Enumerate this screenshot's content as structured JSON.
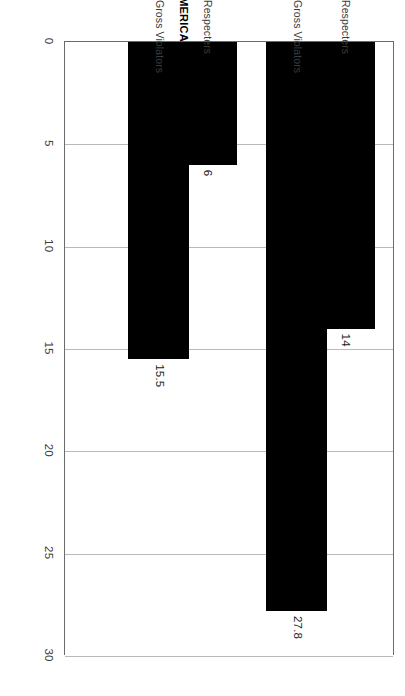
{
  "chart_data": {
    "type": "bar",
    "orientation": "horizontal",
    "title": "",
    "subtitle": "",
    "xlabel": "",
    "ylabel": "",
    "xlim": [
      0,
      30
    ],
    "ylim": null,
    "grid": true,
    "grid_axis": "value",
    "legend": false,
    "legend_position": "none",
    "bar_color": "#000000",
    "axis_color": "#6b6b6b",
    "gridline_color": "#b9b9b9",
    "categories": [
      "Respecters",
      "Gross Violators",
      "Respecters",
      "Gross Violators"
    ],
    "values": [
      14,
      27.8,
      6,
      15.5
    ],
    "data_labels": [
      "14",
      "27.8",
      "6",
      "15.5"
    ],
    "groups": [
      {
        "name": "AFRICA/W/SW",
        "categories": [
          "Respecters",
          "Gross Violators"
        ],
        "values": [
          14,
          27.8
        ],
        "data_labels": [
          "14",
          "27.8"
        ]
      },
      {
        "name": "CARIBBEAN & CENTRAL AMERICA",
        "categories": [
          "Respecters",
          "Gross Violators"
        ],
        "values": [
          6,
          15.5
        ],
        "data_labels": [
          "6",
          "15.5"
        ]
      }
    ],
    "ticks": [
      0,
      5,
      10,
      15,
      20,
      25,
      30
    ],
    "tick_labels": [
      "0",
      "5",
      "10",
      "15",
      "20",
      "25",
      "30"
    ]
  },
  "axis": {
    "ticks": [
      {
        "value": 0,
        "label": "0"
      },
      {
        "value": 5,
        "label": "5"
      },
      {
        "value": 10,
        "label": "10"
      },
      {
        "value": 15,
        "label": "15"
      },
      {
        "value": 20,
        "label": "20"
      },
      {
        "value": 25,
        "label": "25"
      },
      {
        "value": 30,
        "label": "30"
      }
    ]
  },
  "bars": [
    {
      "category": "Respecters",
      "group": "AFRICA/W/SW",
      "value": 14,
      "label": "14"
    },
    {
      "category": "Gross Violators",
      "group": "AFRICA/W/SW",
      "value": 27.8,
      "label": "27.8"
    },
    {
      "category": "Respecters",
      "group": "CARIBBEAN & CENTRAL AMERICA",
      "value": 6,
      "label": "6"
    },
    {
      "category": "Gross Violators",
      "group": "CARIBBEAN & CENTRAL AMERICA",
      "value": 15.5,
      "label": "15.5"
    }
  ],
  "groups": [
    {
      "name": "AFRICA/W/SW"
    },
    {
      "name": "CARIBBEAN & CENTRAL AMERICA"
    }
  ]
}
